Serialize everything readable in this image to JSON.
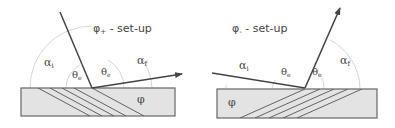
{
  "diagrams": [
    {
      "title": "φ+ - set-up",
      "title_symbol": "φ",
      "title_sub": "+",
      "title_rest": " - set-up",
      "labels": {
        "alpha_i": "α",
        "alpha_i_sub": "i",
        "theta_left": "θ",
        "theta_left_sub": "e",
        "theta_right": "θ",
        "theta_right_sub": "e",
        "alpha_f": "α",
        "alpha_f_sub": "f",
        "phi": "φ"
      }
    },
    {
      "title": "φ- - set-up",
      "title_symbol": "φ",
      "title_sub": "-",
      "title_rest": " - set-up",
      "labels": {
        "alpha_i": "α",
        "alpha_i_sub": "i",
        "theta_left": "θ",
        "theta_left_sub": "e",
        "theta_right": "θ",
        "theta_right_sub": "e",
        "alpha_f": "α",
        "alpha_f_sub": "f",
        "phi": "φ"
      }
    }
  ],
  "colors": {
    "substrate_fill": "#e3e3e3",
    "substrate_stroke": "#666666",
    "beam": "#444444",
    "arc": "#cccccc"
  }
}
